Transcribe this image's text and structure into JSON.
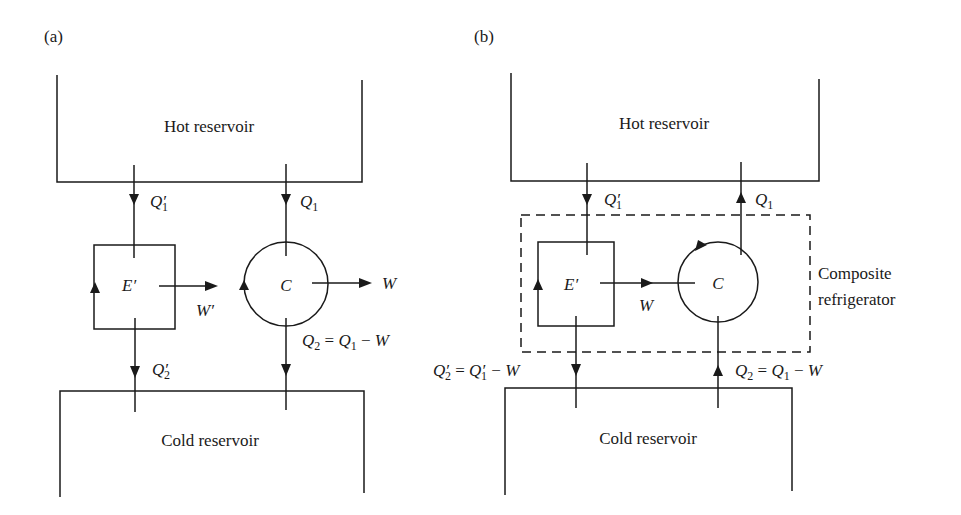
{
  "panels": [
    {
      "id": "a",
      "label": "(a)",
      "hot_reservoir": "Hot reservoir",
      "cold_reservoir": "Cold reservoir",
      "engine": {
        "symbol": "E",
        "prime": "′"
      },
      "carnot": {
        "symbol": "C"
      },
      "flows": {
        "q1_prime": {
          "base": "Q",
          "prime": "′",
          "sub": "1",
          "direction": "down"
        },
        "q1": {
          "base": "Q",
          "sub": "1",
          "direction": "down"
        },
        "q2_prime": {
          "base": "Q",
          "prime": "′",
          "sub": "2",
          "direction": "down"
        },
        "q2": {
          "lhs_base": "Q",
          "lhs_sub": "2",
          "eq": " = ",
          "rhs_base": "Q",
          "rhs_sub": "1",
          "minus": " − ",
          "rhs_w": "W",
          "direction": "down"
        },
        "w_prime": {
          "text": "W′",
          "direction": "right"
        },
        "w": {
          "text": "W",
          "direction": "right"
        }
      }
    },
    {
      "id": "b",
      "label": "(b)",
      "hot_reservoir": "Hot reservoir",
      "cold_reservoir": "Cold reservoir",
      "engine": {
        "symbol": "E",
        "prime": "′"
      },
      "carnot": {
        "symbol": "C"
      },
      "composite_label_line1": "Composite",
      "composite_label_line2": "refrigerator",
      "flows": {
        "q1_prime": {
          "base": "Q",
          "prime": "′",
          "sub": "1",
          "direction": "down"
        },
        "q1": {
          "base": "Q",
          "sub": "1",
          "direction": "up"
        },
        "q2_prime": {
          "lhs_base": "Q",
          "lhs_prime": "′",
          "lhs_sub": "2",
          "eq": " = ",
          "rhs_base": "Q",
          "rhs_prime": "′",
          "rhs_sub": "1",
          "minus": " − ",
          "rhs_w": "W",
          "direction": "down"
        },
        "q2": {
          "lhs_base": "Q",
          "lhs_sub": "2",
          "eq": " = ",
          "rhs_base": "Q",
          "rhs_sub": "1",
          "minus": " − ",
          "rhs_w": "W",
          "direction": "up"
        },
        "w": {
          "text": "W",
          "direction": "right"
        }
      }
    }
  ]
}
